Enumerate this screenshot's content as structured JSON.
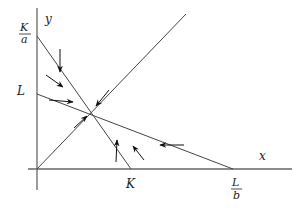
{
  "diagram": {
    "type": "phase-plane",
    "axes": {
      "x_label": "x",
      "y_label": "y"
    },
    "tick_labels": {
      "y_intercept_top_num": "K",
      "y_intercept_top_den": "a",
      "y_intercept_L": "L",
      "x_intercept_K": "K",
      "x_intercept_top_num": "L",
      "x_intercept_top_den": "b"
    },
    "lines": [
      {
        "name": "nullcline-1",
        "from": "K/a on y-axis",
        "to": "K on x-axis"
      },
      {
        "name": "nullcline-2",
        "from": "L on y-axis",
        "to": "L/b on x-axis"
      },
      {
        "name": "diagonal",
        "from": "origin",
        "to": "upper right"
      }
    ],
    "equilibrium": "intersection of nullclines",
    "arrow_count": 8,
    "colors": {
      "line": "#555555",
      "arrow": "#111111",
      "text": "#222222"
    }
  }
}
